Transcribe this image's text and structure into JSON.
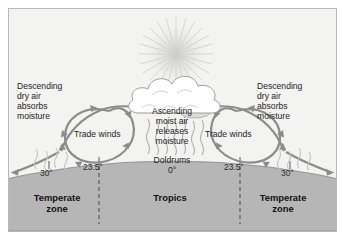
{
  "diagram": {
    "background_color": "#f7f7f5",
    "border_color": "#b9b9b4",
    "earth_fill": "#b6b6b6",
    "sky_fill": "#f3f3f1",
    "arrow_color": "#8c8c8c",
    "cloud_fill": "#ffffff",
    "sun_color": "#c9c9c9",
    "text_color": "#1d1d1d"
  },
  "annotations": {
    "left_descending": "Descending\ndry air\nabsorbs\nmoisture",
    "left_descending_lines": [
      "Descending",
      "dry air",
      "absorbs",
      "moisture"
    ],
    "right_descending_lines": [
      "Descending",
      "dry air",
      "absorbs",
      "moisture"
    ],
    "ascending_lines": [
      "Ascending",
      "moist air",
      "releases",
      "moisture"
    ],
    "trade_winds_left": "Trade winds",
    "trade_winds_right": "Trade winds",
    "doldrums_label": "Doldrums",
    "doldrums_value": "0°"
  },
  "latitudes": {
    "left_thirty": "30°",
    "left_tropic": "23.5°",
    "equator": "0°",
    "right_tropic": "23.5°",
    "right_thirty": "30°"
  },
  "zones": [
    {
      "name": "Temperate zone",
      "line1": "Temperate",
      "line2": "zone"
    },
    {
      "name": "Tropics",
      "line1": "Tropics",
      "line2": ""
    },
    {
      "name": "Temperate zone",
      "line1": "Temperate",
      "line2": "zone"
    }
  ],
  "icons": {
    "sun": "sun-icon",
    "cloud": "cloud-icon",
    "rain": "rain-icon",
    "circulation": "circulation-arrow-icon"
  }
}
